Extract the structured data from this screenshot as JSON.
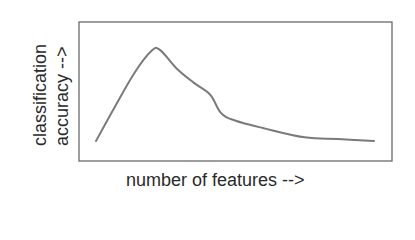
{
  "chart_data": {
    "type": "line",
    "title": "",
    "xlabel": "number of features -->",
    "ylabel_lines": [
      "classification",
      "accuracy -->"
    ],
    "ylabel": "classification accuracy -->",
    "grid": false,
    "legend": null,
    "ticks": false,
    "series": [
      {
        "name": "accuracy vs features",
        "x": [
          0.0,
          0.07,
          0.14,
          0.2,
          0.23,
          0.29,
          0.35,
          0.41,
          0.45,
          0.5,
          0.6,
          0.75,
          0.87,
          1.0
        ],
        "values": [
          0.0,
          0.38,
          0.74,
          0.97,
          0.98,
          0.78,
          0.63,
          0.5,
          0.3,
          0.22,
          0.14,
          0.04,
          0.02,
          0.0
        ]
      }
    ],
    "annotation": "Accuracy rises to a peak then declines as number of features increases (peaking phenomenon)"
  },
  "colors": {
    "line": "#7a7a7a",
    "axis": "#555555",
    "text": "#2a2a2a"
  }
}
